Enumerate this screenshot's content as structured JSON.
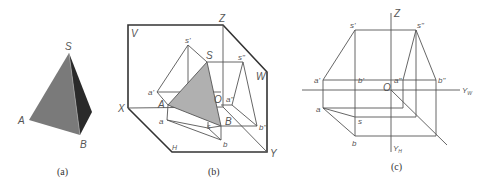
{
  "panels": {
    "a": {
      "caption": "(a)",
      "labels": {
        "S": "S",
        "A": "A",
        "B": "B"
      },
      "colors": {
        "front_face": "#7a7a7a",
        "side_face": "#2a2a2a"
      }
    },
    "b": {
      "caption": "(b)",
      "labels": {
        "V": "V",
        "W": "W",
        "H": "H",
        "X": "X",
        "Y": "Y",
        "Z": "Z",
        "O": "O",
        "S": "S",
        "A": "A",
        "B": "B",
        "s_prime": "s'",
        "a_prime": "a'",
        "s_dprime": "s\"",
        "a_dprime": "a\"",
        "b_dprime": "b\"",
        "a": "a",
        "s": "s",
        "b": "b"
      },
      "colors": {
        "triangle_fill": "#b0b0b0"
      }
    },
    "c": {
      "caption": "(c)",
      "labels": {
        "Z": "Z",
        "O": "O",
        "X": "X",
        "Y_W": "Y",
        "Y_W_sub": "W",
        "Y_H": "Y",
        "Y_H_sub": "H",
        "s_prime": "s'",
        "a_prime": "a'",
        "b_prime": "b'",
        "s_dprime": "s\"",
        "a_dprime": "a\"",
        "b_dprime": "b\"",
        "a": "a",
        "s": "s",
        "b": "b"
      }
    }
  }
}
